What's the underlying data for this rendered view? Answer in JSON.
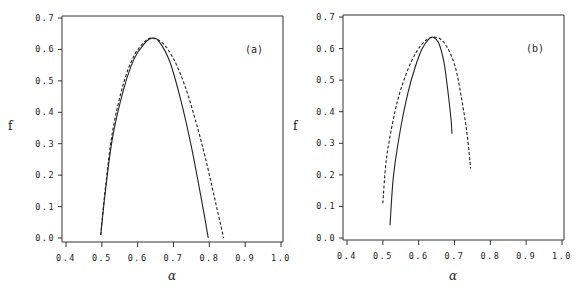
{
  "chart_data": [
    {
      "type": "line",
      "panel_label": "(a)",
      "xlabel": "α",
      "ylabel": "f",
      "xlim": [
        0.4,
        1.0
      ],
      "ylim": [
        0.0,
        0.7
      ],
      "xticks": [
        "0.4",
        "0.5",
        "0.6",
        "0.7",
        "0.8",
        "0.9",
        "1.0"
      ],
      "yticks": [
        "0.0",
        "0.1",
        "0.2",
        "0.3",
        "0.4",
        "0.5",
        "0.6",
        "0.7"
      ],
      "grid": false,
      "series": [
        {
          "name": "solid",
          "style": "solid",
          "x": [
            0.497,
            0.51,
            0.53,
            0.56,
            0.59,
            0.62,
            0.64,
            0.66,
            0.69,
            0.72,
            0.75,
            0.78,
            0.797
          ],
          "y": [
            0.01,
            0.15,
            0.32,
            0.47,
            0.57,
            0.62,
            0.636,
            0.625,
            0.56,
            0.44,
            0.29,
            0.11,
            0.0
          ]
        },
        {
          "name": "dashed",
          "style": "dashed",
          "x": [
            0.497,
            0.51,
            0.53,
            0.56,
            0.59,
            0.62,
            0.64,
            0.67,
            0.7,
            0.73,
            0.76,
            0.79,
            0.82,
            0.84
          ],
          "y": [
            0.01,
            0.16,
            0.34,
            0.49,
            0.58,
            0.625,
            0.636,
            0.62,
            0.57,
            0.49,
            0.38,
            0.25,
            0.1,
            0.0
          ]
        }
      ]
    },
    {
      "type": "line",
      "panel_label": "(b)",
      "xlabel": "α",
      "ylabel": "f",
      "xlim": [
        0.4,
        1.0
      ],
      "ylim": [
        0.0,
        0.7
      ],
      "xticks": [
        "0.4",
        "0.5",
        "0.6",
        "0.7",
        "0.8",
        "0.9",
        "1.0"
      ],
      "yticks": [
        "0.0",
        "0.1",
        "0.2",
        "0.3",
        "0.4",
        "0.5",
        "0.6",
        "0.7"
      ],
      "grid": false,
      "series": [
        {
          "name": "solid",
          "style": "solid",
          "x": [
            0.52,
            0.53,
            0.55,
            0.57,
            0.59,
            0.61,
            0.63,
            0.64,
            0.655,
            0.67,
            0.68,
            0.69,
            0.693
          ],
          "y": [
            0.04,
            0.2,
            0.35,
            0.46,
            0.54,
            0.6,
            0.632,
            0.636,
            0.62,
            0.56,
            0.48,
            0.38,
            0.33
          ]
        },
        {
          "name": "dashed",
          "style": "dashed",
          "x": [
            0.5,
            0.51,
            0.53,
            0.55,
            0.58,
            0.61,
            0.64,
            0.67,
            0.7,
            0.72,
            0.735,
            0.745
          ],
          "y": [
            0.11,
            0.25,
            0.38,
            0.47,
            0.56,
            0.615,
            0.636,
            0.62,
            0.55,
            0.44,
            0.33,
            0.22
          ]
        }
      ]
    }
  ]
}
